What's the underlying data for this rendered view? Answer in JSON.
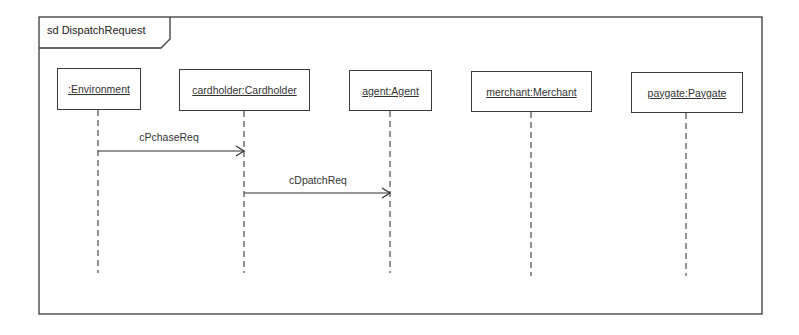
{
  "diagram": {
    "type": "UML sequence diagram",
    "frame": {
      "label": "sd DispatchRequest",
      "colors": {
        "line": "#3a3a3a",
        "background": "#ffffff",
        "text": "#222222"
      }
    },
    "lifelines": [
      {
        "id": "environment",
        "label": ":Environment"
      },
      {
        "id": "cardholder",
        "label": "cardholder:Cardholder"
      },
      {
        "id": "agent",
        "label": "agent:Agent"
      },
      {
        "id": "merchant",
        "label": "merchant:Merchant"
      },
      {
        "id": "paygate",
        "label": "paygate:Paygate"
      }
    ],
    "messages": [
      {
        "label": "cPchaseReq",
        "from": ":Environment",
        "to": "cardholder:Cardholder",
        "kind": "asynchronous"
      },
      {
        "label": "cDpatchReq",
        "from": "cardholder:Cardholder",
        "to": "agent:Agent",
        "kind": "asynchronous"
      }
    ]
  }
}
